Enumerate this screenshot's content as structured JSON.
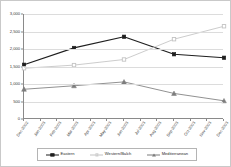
{
  "chart_data": {
    "type": "line",
    "title": "",
    "xlabel": "",
    "ylabel": "",
    "ylim": [
      0,
      3000
    ],
    "ytick_interval": 500,
    "grid": true,
    "legend_position": "bottom",
    "categories": [
      "Dec-2002",
      "Jan-2003",
      "Feb-2003",
      "Mar-2003",
      "Apr-2003",
      "May-2003",
      "Jun-2003",
      "Jul-2003",
      "Aug-2003",
      "Sep-2003",
      "Oct-2003",
      "Nov-2003",
      "Dec-2003"
    ],
    "y_tick_labels": [
      "0",
      "500",
      "1,000",
      "1,500",
      "2,000",
      "2,500",
      "3,000"
    ],
    "y_tick_values": [
      0,
      500,
      1000,
      1500,
      2000,
      2500,
      3000
    ],
    "marker_indices": [
      0,
      3,
      6,
      9,
      12
    ],
    "series": [
      {
        "name": "Eastern",
        "color": "#1f1f1f",
        "marker": "square-filled",
        "values": [
          1550,
          null,
          null,
          2030,
          null,
          null,
          2350,
          null,
          null,
          1850,
          null,
          null,
          1750
        ],
        "marker_values": [
          1550,
          2030,
          2350,
          1850,
          1750
        ]
      },
      {
        "name": "Western/Balch",
        "color": "#c3c3c3",
        "marker": "square-open",
        "values": [
          1450,
          null,
          null,
          1540,
          null,
          null,
          1700,
          null,
          null,
          2280,
          null,
          null,
          2650
        ],
        "marker_values": [
          1450,
          1540,
          1700,
          2280,
          2650
        ]
      },
      {
        "name": "Mediterranean",
        "color": "#7d7d7d",
        "marker": "triangle",
        "values": [
          850,
          null,
          null,
          950,
          null,
          null,
          1060,
          null,
          null,
          730,
          null,
          null,
          520
        ],
        "marker_values": [
          850,
          950,
          1060,
          730,
          520
        ]
      }
    ]
  },
  "legend": {
    "items": [
      {
        "label": "Eastern"
      },
      {
        "label": "Western/Balch"
      },
      {
        "label": "Mediterranean"
      }
    ]
  }
}
